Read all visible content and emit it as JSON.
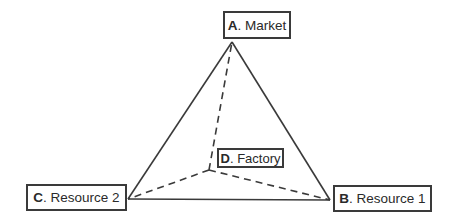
{
  "diagram": {
    "type": "weber-location-triangle",
    "line_color": "#3a3a3a",
    "nodes": [
      {
        "id": "A",
        "letter": "A",
        "label": ". Market",
        "x": 232,
        "y": 42
      },
      {
        "id": "B",
        "letter": "B",
        "label": ". Resource 1",
        "x": 330,
        "y": 200
      },
      {
        "id": "C",
        "letter": "C",
        "label": ". Resource 2",
        "x": 128,
        "y": 199
      },
      {
        "id": "D",
        "letter": "D",
        "label": ". Factory",
        "x": 209,
        "y": 170
      }
    ],
    "solid_edges": [
      [
        "A",
        "B"
      ],
      [
        "B",
        "C"
      ],
      [
        "C",
        "A"
      ]
    ],
    "dashed_edges": [
      [
        "D",
        "A"
      ],
      [
        "D",
        "B"
      ],
      [
        "D",
        "C"
      ]
    ]
  }
}
